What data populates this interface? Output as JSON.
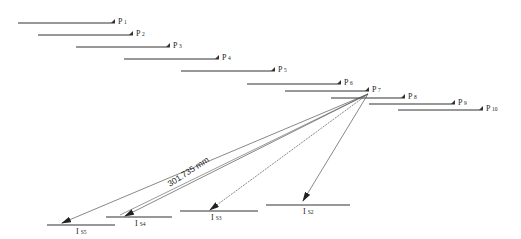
{
  "diagram": {
    "apex": {
      "x": 368,
      "y": 94
    },
    "scan_lines": [
      {
        "id": "P1",
        "prefix": "P",
        "sub": "1",
        "x1": 18,
        "x2": 115,
        "y": 23
      },
      {
        "id": "P2",
        "prefix": "P",
        "sub": "2",
        "x1": 38,
        "x2": 133,
        "y": 35
      },
      {
        "id": "P3",
        "prefix": "P",
        "sub": "3",
        "x1": 76,
        "x2": 170,
        "y": 47
      },
      {
        "id": "P4",
        "prefix": "P",
        "sub": "4",
        "x1": 124,
        "x2": 219,
        "y": 59
      },
      {
        "id": "P5",
        "prefix": "P",
        "sub": "5",
        "x1": 181,
        "x2": 275,
        "y": 71
      },
      {
        "id": "P6",
        "prefix": "P",
        "sub": "6",
        "x1": 247,
        "x2": 341,
        "y": 84
      },
      {
        "id": "P7",
        "prefix": "P",
        "sub": "7",
        "x1": 285,
        "x2": 369,
        "y": 91
      },
      {
        "id": "P8",
        "prefix": "P",
        "sub": "8",
        "x1": 331,
        "x2": 405,
        "y": 98
      },
      {
        "id": "P9",
        "prefix": "P",
        "sub": "9",
        "x1": 369,
        "x2": 455,
        "y": 104
      },
      {
        "id": "P10",
        "prefix": "P",
        "sub": "10",
        "x1": 398,
        "x2": 483,
        "y": 110
      }
    ],
    "targets": [
      {
        "id": "IS5",
        "prefix": "I",
        "sub": "S5",
        "x1": 47,
        "x2": 115,
        "y": 225,
        "tip_x": 62,
        "tip_y": 223,
        "dashed": false,
        "label_x": 76
      },
      {
        "id": "IS4",
        "prefix": "I",
        "sub": "S4",
        "x1": 106,
        "x2": 172,
        "y": 217,
        "tip_x": 125,
        "tip_y": 216,
        "dashed": false,
        "label_x": 135
      },
      {
        "id": "IS3",
        "prefix": "I",
        "sub": "S3",
        "x1": 180,
        "x2": 258,
        "y": 211,
        "tip_x": 210,
        "tip_y": 210,
        "dashed": true,
        "label_x": 211
      },
      {
        "id": "IS2",
        "prefix": "I",
        "sub": "S2",
        "x1": 266,
        "x2": 350,
        "y": 205,
        "tip_x": 303,
        "tip_y": 201,
        "dashed": false,
        "label_x": 303
      }
    ],
    "dimension_label": {
      "text": "301.735 mm",
      "x": 170,
      "y": 187,
      "angle": -33
    },
    "colors": {
      "line": "#333333",
      "thin_ray": "#555555"
    }
  }
}
